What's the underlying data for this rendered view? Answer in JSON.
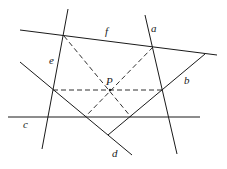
{
  "diagram": {
    "type": "geometry-construction",
    "labels": {
      "a": "a",
      "b": "b",
      "c": "c",
      "d": "d",
      "e": "e",
      "f": "f",
      "P": "P"
    },
    "lines": [
      {
        "name": "a",
        "x1": 145,
        "y1": 15,
        "x2": 177,
        "y2": 154,
        "style": "solid"
      },
      {
        "name": "b",
        "x1": 205,
        "y1": 54,
        "x2": 108,
        "y2": 135,
        "style": "solid"
      },
      {
        "name": "c",
        "x1": 8,
        "y1": 117,
        "x2": 200,
        "y2": 117,
        "style": "solid"
      },
      {
        "name": "d",
        "x1": 20,
        "y1": 62,
        "x2": 132,
        "y2": 155,
        "style": "solid"
      },
      {
        "name": "e",
        "x1": 68,
        "y1": 9,
        "x2": 42,
        "y2": 149,
        "style": "solid"
      },
      {
        "name": "f",
        "x1": 20,
        "y1": 30,
        "x2": 217,
        "y2": 55,
        "style": "solid"
      }
    ],
    "dashed_segments": [
      {
        "from": "e∩f",
        "to": "b∩c",
        "x1": 64,
        "y1": 36,
        "x2": 131,
        "y2": 117
      },
      {
        "from": "a∩f",
        "to": "d∩c",
        "x1": 153,
        "y1": 47,
        "x2": 85,
        "y2": 117
      },
      {
        "from": "e∩d",
        "to": "a∩b",
        "x1": 53,
        "y1": 90,
        "x2": 162,
        "y2": 90
      }
    ],
    "points": {
      "P": {
        "x": 110,
        "y": 90
      }
    },
    "colors": {
      "stroke": "#1a1a1a",
      "background": "#ffffff"
    }
  }
}
